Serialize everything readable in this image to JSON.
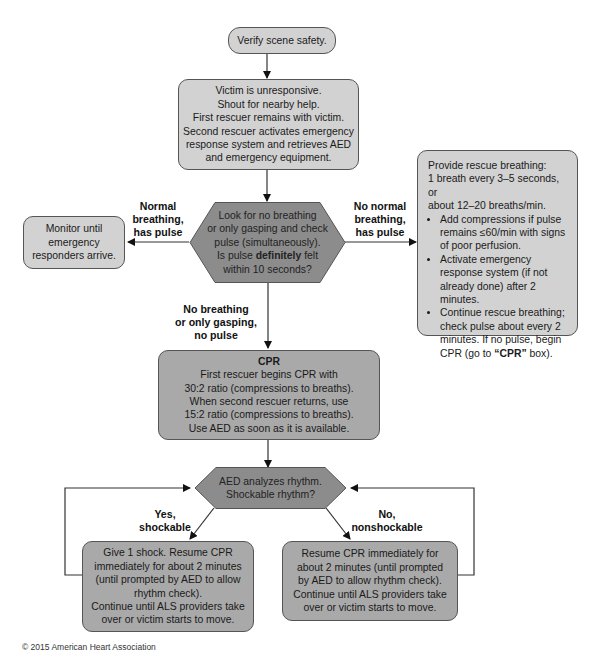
{
  "flowchart": {
    "verify": "Verify scene safety.",
    "victim": {
      "lines": [
        "Victim is unresponsive.",
        "Shout for nearby help.",
        "First rescuer remains with victim.",
        "Second rescuer activates emergency",
        "response system and retrieves AED",
        "and emergency equipment."
      ]
    },
    "check": {
      "line1": "Look for no breathing",
      "line2": "or only gasping and check",
      "line3": "pulse (simultaneously).",
      "line4_pre": "Is pulse ",
      "line4_bold": "definitely",
      "line4_post": " felt",
      "line5": "within 10 seconds?"
    },
    "monitor": {
      "lines": [
        "Monitor until",
        "emergency",
        "responders arrive."
      ]
    },
    "rescue_breathing": {
      "intro1": "Provide rescue breathing:",
      "intro2": "1 breath every 3–5 seconds, or",
      "intro3": "about 12–20 breaths/min.",
      "bullet1": "Add compressions if pulse remains ≤60/min with signs of poor perfusion.",
      "bullet2": "Activate emergency response system (if not already done) after 2 minutes.",
      "bullet3_pre": "Continue rescue breathing; check pulse about every 2 minutes. If no pulse, begin CPR (go to ",
      "bullet3_bold": "“CPR”",
      "bullet3_post": " box)."
    },
    "cpr": {
      "title": "CPR",
      "lines": [
        "First rescuer begins CPR with",
        "30:2 ratio (compressions to breaths).",
        "When second rescuer returns, use",
        "15:2 ratio (compressions to breaths).",
        "Use AED as soon as it is available."
      ]
    },
    "aed": {
      "line1": "AED analyzes rhythm.",
      "line2": "Shockable rhythm?"
    },
    "shock": {
      "lines": [
        "Give 1 shock. Resume CPR",
        "immediately for about 2 minutes",
        "(until prompted by AED to allow",
        "rhythm check).",
        "Continue until ALS providers take",
        "over or victim starts to move."
      ]
    },
    "noshock": {
      "lines": [
        "Resume CPR immediately for",
        "about 2 minutes (until prompted",
        "by AED to allow rhythm check).",
        "Continue until ALS providers take",
        "over or victim starts to move."
      ]
    },
    "labels": {
      "normal_breathing": [
        "Normal",
        "breathing,",
        "has pulse"
      ],
      "no_normal_breathing": [
        "No normal",
        "breathing,",
        "has pulse"
      ],
      "no_breathing": [
        "No breathing",
        "or only gasping,",
        "no pulse"
      ],
      "yes_shockable": [
        "Yes,",
        "shockable"
      ],
      "no_nonshockable": [
        "No,",
        "nonshockable"
      ]
    },
    "colors": {
      "light_box": "#d2d2d2",
      "mid_box": "#a9a9a9",
      "decision": "#8c8c8c"
    }
  },
  "footer": {
    "copyright": "© 2015 American Heart Association"
  }
}
